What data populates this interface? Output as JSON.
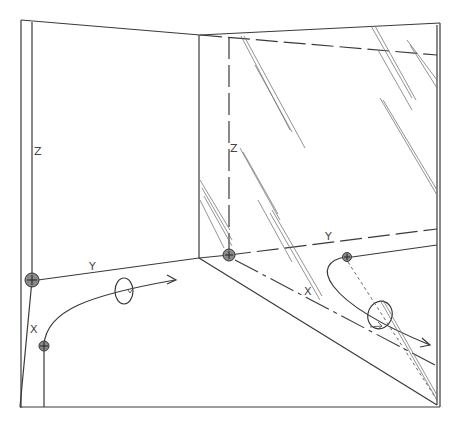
{
  "diagram": {
    "left_view": {
      "labels": {
        "z": "Z",
        "y": "Y",
        "x": "X"
      },
      "origin_marker": "screw-point",
      "secondary_marker": "screw-point",
      "path": "curved arrow with rotation loop"
    },
    "right_view": {
      "labels": {
        "z": "Z",
        "y": "Y",
        "x": "X"
      },
      "origin_marker": "screw-point",
      "secondary_marker": "screw-point",
      "path": "hooked arrow with rotation loop",
      "surface": "glass wall with glare streaks"
    },
    "colors": {
      "line": "#3a3a3a",
      "marker": "#8a8a8a",
      "background": "#ffffff"
    }
  }
}
